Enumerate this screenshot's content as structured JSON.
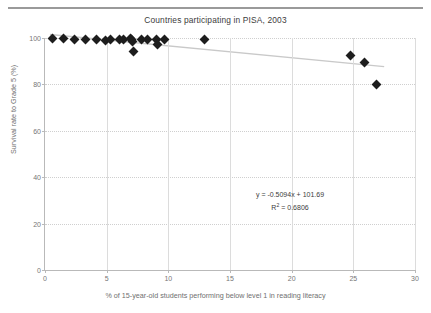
{
  "header": {
    "rule_visible": true
  },
  "chart_data": {
    "type": "scatter",
    "title": "Countries participating in PISA, 2003",
    "xlabel": "% of 15-year-old students performing below level 1 in reading literacy",
    "ylabel": "Survival rate to Grade 5 (%)",
    "xlim": [
      0,
      30
    ],
    "ylim": [
      0,
      100
    ],
    "xticks": [
      0,
      5,
      10,
      15,
      20,
      25,
      30
    ],
    "yticks": [
      0,
      20,
      40,
      60,
      80,
      100
    ],
    "xtick_labels": [
      "0",
      "5",
      "10",
      "15",
      "20",
      "25",
      "30"
    ],
    "ytick_labels": [
      "0",
      "20",
      "40",
      "60",
      "80",
      "100"
    ],
    "grid": {
      "horizontal": "dotted",
      "vertical": "solid"
    },
    "legend": null,
    "marker": {
      "shape": "diamond",
      "color": "#1d1d1d",
      "size": 7
    },
    "series": [
      {
        "name": "Countries",
        "points": [
          [
            0.6,
            100.0
          ],
          [
            1.5,
            99.6
          ],
          [
            2.4,
            99.4
          ],
          [
            3.3,
            99.5
          ],
          [
            4.2,
            99.3
          ],
          [
            4.9,
            99.0
          ],
          [
            5.3,
            99.2
          ],
          [
            6.0,
            99.5
          ],
          [
            6.4,
            99.2
          ],
          [
            6.9,
            100.0
          ],
          [
            7.0,
            99.2
          ],
          [
            7.1,
            98.3
          ],
          [
            7.2,
            94.3
          ],
          [
            7.8,
            99.3
          ],
          [
            8.3,
            99.2
          ],
          [
            9.0,
            99.2
          ],
          [
            9.1,
            97.1
          ],
          [
            9.7,
            99.5
          ],
          [
            12.9,
            99.4
          ],
          [
            24.8,
            92.3
          ],
          [
            25.9,
            89.6
          ],
          [
            26.9,
            79.8
          ]
        ]
      }
    ],
    "trendline": {
      "equation_label": "y = -0.5094x + 101.69",
      "r2_label_prefix": "R",
      "r2_label_exponent": "2",
      "r2_label_suffix": " = 0.6806",
      "slope": -0.5094,
      "intercept": 101.69,
      "r_squared": 0.6806,
      "color": "#c9c9c9",
      "x_start": 0.4,
      "x_end": 27.5
    }
  }
}
